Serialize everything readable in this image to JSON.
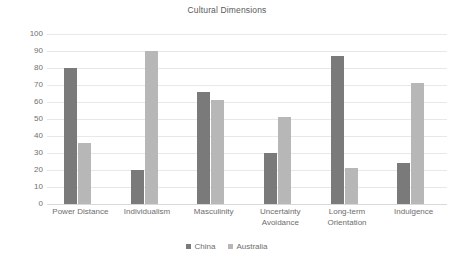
{
  "chart_data": {
    "type": "bar",
    "title": "Cultural Dimensions",
    "xlabel": "",
    "ylabel": "",
    "ylim": [
      0,
      100
    ],
    "ytick_step": 10,
    "yticks": [
      100,
      90,
      80,
      70,
      60,
      50,
      40,
      30,
      20,
      10,
      0
    ],
    "ytick_labels": [
      "100",
      "90",
      "80",
      "70",
      "60",
      "50",
      "40",
      "30",
      "20",
      "10",
      "0"
    ],
    "grid": true,
    "grid_axis": "y",
    "legend_position": "bottom",
    "categories": [
      "Power Distance",
      "Individualism",
      "Masculinity",
      "Uncertainty\nAvoidance",
      "Long-term\nOrientation",
      "Indulgence"
    ],
    "series": [
      {
        "name": "China",
        "color": "#7a7a7a",
        "values": [
          80,
          20,
          66,
          30,
          87,
          24
        ]
      },
      {
        "name": "Australia",
        "color": "#b7b7b7",
        "values": [
          36,
          90,
          61,
          51,
          21,
          71
        ]
      }
    ]
  }
}
